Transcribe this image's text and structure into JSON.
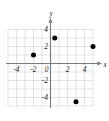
{
  "figure": {
    "title": "",
    "background_color": "#ffffff"
  },
  "chart_data": {
    "type": "scatter",
    "title": "",
    "xlabel": "x",
    "ylabel": "y",
    "xlim": [
      -5.4,
      5.6
    ],
    "ylim": [
      -5.6,
      5.2
    ],
    "grid": true,
    "grid_spacing": 1,
    "legend": "none",
    "xticks": [
      -4,
      -2,
      0,
      2,
      4
    ],
    "xtick_labels": [
      "-4",
      "-2",
      "0",
      "2",
      "4"
    ],
    "yticks": [
      4,
      2,
      -2,
      -4
    ],
    "ytick_labels": [
      "4",
      "2",
      "-2",
      "-4"
    ],
    "origin_label": "0",
    "point_color": "#000000",
    "grid_color": "#d6d6d6",
    "axis_color": "#7a7a7a",
    "points": [
      {
        "x": -2,
        "y": 1,
        "label": ""
      },
      {
        "x": 0.5,
        "y": 3,
        "label": ""
      },
      {
        "x": 5,
        "y": 2,
        "label": ""
      },
      {
        "x": 3,
        "y": -4.5,
        "label": ""
      }
    ]
  }
}
